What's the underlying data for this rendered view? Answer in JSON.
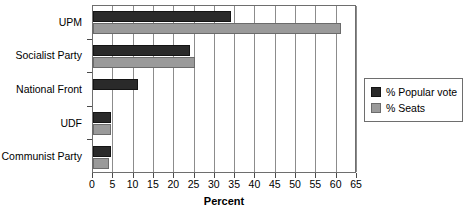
{
  "chart_data": {
    "type": "bar",
    "orientation": "horizontal",
    "title": "",
    "xlabel": "Percent",
    "ylabel": "",
    "xlim": [
      0,
      65
    ],
    "xticks": [
      0,
      5,
      10,
      15,
      20,
      25,
      30,
      35,
      40,
      45,
      50,
      55,
      60,
      65
    ],
    "grid": true,
    "legend_position": "right",
    "categories": [
      "UPM",
      "Socialist Party",
      "National Front",
      "UDF",
      "Communist Party"
    ],
    "series": [
      {
        "name": "% Popular vote",
        "color": "#2a2a2a",
        "values": [
          34,
          24,
          11,
          4.5,
          4.5
        ]
      },
      {
        "name": "% Seats",
        "color": "#9a9a9a",
        "values": [
          61,
          25,
          0,
          4.5,
          4
        ]
      }
    ]
  },
  "legend": {
    "items": [
      {
        "label": "% Popular vote"
      },
      {
        "label": "% Seats"
      }
    ]
  },
  "colors": {
    "vote": "#2a2a2a",
    "seats": "#9a9a9a",
    "axis": "#6e6e6e",
    "grid": "#8c8c8c",
    "background": "#ffffff"
  }
}
